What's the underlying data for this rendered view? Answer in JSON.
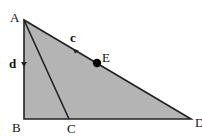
{
  "diagram": {
    "type": "geometry-figure",
    "fill_color": "#b4b4b4",
    "stroke_color": "#222222",
    "points": {
      "A": {
        "label": "A",
        "x": 24,
        "y": 20
      },
      "B": {
        "label": "B",
        "x": 24,
        "y": 119
      },
      "C": {
        "label": "C",
        "x": 69,
        "y": 119
      },
      "D": {
        "label": "D",
        "x": 191,
        "y": 119
      },
      "E": {
        "label": "E",
        "x": 97,
        "y": 63
      }
    },
    "segment_labels": {
      "c": "c",
      "d": "d"
    },
    "segments": [
      "AB",
      "BD",
      "AD",
      "AC"
    ]
  }
}
